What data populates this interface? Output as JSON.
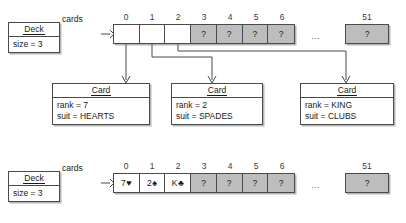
{
  "diagram": {
    "pointer_label": "cards",
    "ellipsis": "…",
    "unknown_symbol": "?"
  },
  "indices": {
    "visible": [
      "0",
      "1",
      "2",
      "3",
      "4",
      "5",
      "6"
    ],
    "last": "51"
  },
  "top": {
    "deck": {
      "class_name": "Deck",
      "fields": [
        "size = 3"
      ]
    },
    "pointer_label": "cards",
    "cells": [
      {
        "index": "0",
        "value": "",
        "state": "empty"
      },
      {
        "index": "1",
        "value": "",
        "state": "empty"
      },
      {
        "index": "2",
        "value": "",
        "state": "empty"
      },
      {
        "index": "3",
        "value": "?",
        "state": "unknown"
      },
      {
        "index": "4",
        "value": "?",
        "state": "unknown"
      },
      {
        "index": "5",
        "value": "?",
        "state": "unknown"
      },
      {
        "index": "6",
        "value": "?",
        "state": "unknown"
      }
    ],
    "tail_cell": {
      "index": "51",
      "value": "?",
      "state": "unknown"
    }
  },
  "cards": [
    {
      "class_name": "Card",
      "fields": [
        "rank = 7",
        "suit = HEARTS"
      ],
      "rank": "7",
      "suit": "HEARTS",
      "from_index": "0"
    },
    {
      "class_name": "Card",
      "fields": [
        "rank = 2",
        "suit = SPADES"
      ],
      "rank": "2",
      "suit": "SPADES",
      "from_index": "1"
    },
    {
      "class_name": "Card",
      "fields": [
        "rank = KING",
        "suit = CLUBS"
      ],
      "rank": "KING",
      "suit": "CLUBS",
      "from_index": "2"
    }
  ],
  "bottom": {
    "deck": {
      "class_name": "Deck",
      "fields": [
        "size = 3"
      ]
    },
    "pointer_label": "cards",
    "cells": [
      {
        "index": "0",
        "rank": "7",
        "suit_glyph": "♥",
        "suit_color": "#1a1a1a",
        "state": "filled"
      },
      {
        "index": "1",
        "rank": "2",
        "suit_glyph": "♠",
        "suit_color": "#1a1a1a",
        "state": "filled"
      },
      {
        "index": "2",
        "rank": "K",
        "suit_glyph": "♣",
        "suit_color": "#1a1a1a",
        "state": "filled"
      },
      {
        "index": "3",
        "value": "?",
        "state": "unknown"
      },
      {
        "index": "4",
        "value": "?",
        "state": "unknown"
      },
      {
        "index": "5",
        "value": "?",
        "state": "unknown"
      },
      {
        "index": "6",
        "value": "?",
        "state": "unknown"
      }
    ],
    "tail_cell": {
      "index": "51",
      "value": "?",
      "state": "unknown"
    }
  },
  "colors": {
    "line": "#4a4a4a",
    "unknown_fill": "#bdbdbd",
    "empty_fill": "#ffffff",
    "text": "#1a1a1a"
  }
}
